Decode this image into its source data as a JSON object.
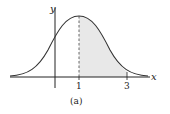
{
  "figure": {
    "caption": "(a)",
    "x_axis_label": "x",
    "y_axis_label": "y",
    "ticks": [
      {
        "value": 1,
        "label": "1"
      },
      {
        "value": 3,
        "label": "3"
      }
    ],
    "curve": "normal density, mean 1",
    "shaded_region": {
      "from": 1,
      "to": 3
    },
    "colors": {
      "curve": "#333333",
      "shade": "#e6e6e6",
      "axis": "#222222"
    }
  }
}
